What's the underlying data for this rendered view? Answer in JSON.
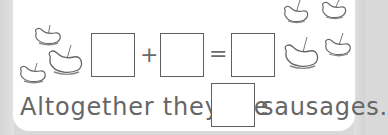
{
  "worksheet": {
    "equation": {
      "operator_plus": "+",
      "operator_equals": "=",
      "boxes": [
        "",
        "",
        ""
      ]
    },
    "sentence": {
      "before": "Altogether they ate",
      "answer_box": "",
      "after": "sausages."
    },
    "illustrations": {
      "left_group": {
        "icon": "sausage-on-fork-icon",
        "count": 3
      },
      "right_group": {
        "icon": "sausage-on-fork-icon",
        "count": 4
      }
    },
    "colors": {
      "text": "#666666",
      "box_border": "#5f5f5f",
      "panel": "#ffffff",
      "background": "#d9d9d9"
    }
  }
}
